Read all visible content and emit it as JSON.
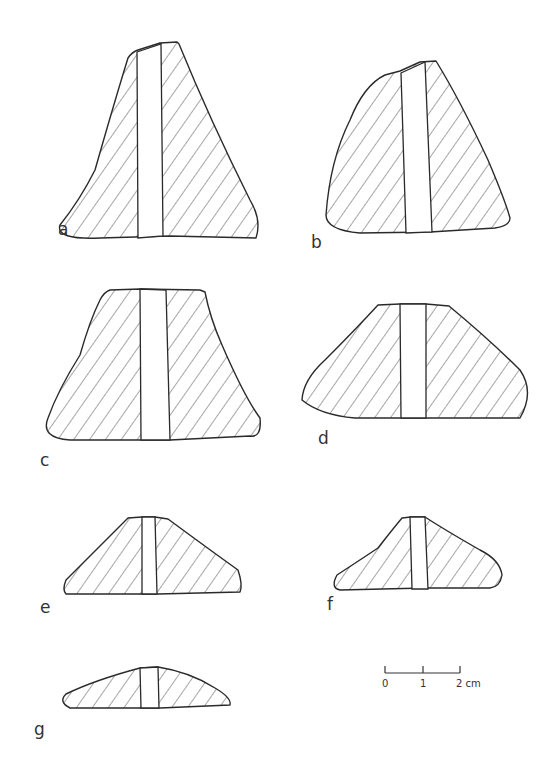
{
  "figure": {
    "items": [
      {
        "id": "a",
        "label": "a"
      },
      {
        "id": "b",
        "label": "b"
      },
      {
        "id": "c",
        "label": "c"
      },
      {
        "id": "d",
        "label": "d"
      },
      {
        "id": "e",
        "label": "e"
      },
      {
        "id": "f",
        "label": "f"
      },
      {
        "id": "g",
        "label": "g"
      }
    ],
    "scale_bar": {
      "ticks": [
        "0",
        "1",
        "2 cm"
      ],
      "unit": "cm",
      "length": 2
    },
    "colors": {
      "line": "#2a2a2a",
      "background": "#ffffff"
    }
  }
}
